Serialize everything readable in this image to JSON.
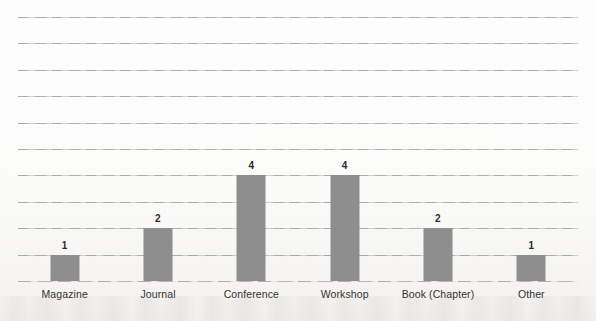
{
  "chart_data": {
    "type": "bar",
    "title": "",
    "subtitle": "",
    "xlabel": "",
    "ylabel": "",
    "categories": [
      "Magazine",
      "Journal",
      "Conference",
      "Workshop",
      "Book (Chapter)",
      "Other"
    ],
    "values": [
      1,
      2,
      4,
      4,
      2,
      1
    ],
    "data_labels": [
      "1",
      "2",
      "4",
      "4",
      "2",
      "1"
    ],
    "ylim": [
      0,
      10
    ],
    "y_tick_step": 1,
    "y_tick_labels_visible": false,
    "gridlines": {
      "orientation": "horizontal",
      "count": 10,
      "visible": true,
      "values": [
        1,
        2,
        3,
        4,
        5,
        6,
        7,
        8,
        9,
        10
      ]
    },
    "legend": {
      "visible": false,
      "entries": []
    },
    "series": [
      {
        "name": "Publications",
        "values": [
          1,
          2,
          4,
          4,
          2,
          1
        ],
        "color": "#8e8e8e"
      }
    ],
    "annotations": []
  },
  "style": {
    "bar_color": "#8e8e8e",
    "gridline_color": "#828282",
    "label_color": "#33312e",
    "value_label_color": "#2a2a2a",
    "background_color": "#fdfdfd"
  }
}
